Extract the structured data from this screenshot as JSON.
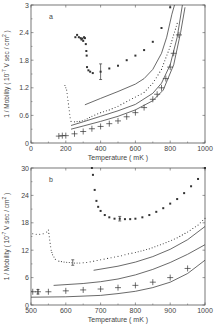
{
  "chart_data": [
    {
      "type": "scatter",
      "panel_label": "a",
      "title": "",
      "xlabel": "Temperature (mK)",
      "ylabel": "1 / Mobility (10^-7 V sec / cm^2)",
      "xlim": [
        0,
        1000
      ],
      "ylim": [
        0,
        3
      ],
      "xticks": [
        "0",
        "200",
        "400",
        "600",
        "800",
        "1000"
      ],
      "yticks": [
        "0",
        "0.6",
        "1.2",
        "1.8",
        "2.4",
        "3"
      ],
      "grid": false,
      "legend": "none",
      "series": [
        {
          "name": "upper dots (filled squares)",
          "style": "square-markers",
          "points": [
            [
              255,
              2.3
            ],
            [
              265,
              2.35
            ],
            [
              275,
              2.3
            ],
            [
              285,
              2.28
            ],
            [
              290,
              2.25
            ],
            [
              295,
              2.27
            ],
            [
              300,
              2.22
            ],
            [
              305,
              2.3
            ],
            [
              310,
              2.28
            ],
            [
              315,
              2.15
            ],
            [
              318,
              2.0
            ],
            [
              320,
              1.9
            ],
            [
              322,
              1.65
            ],
            [
              330,
              1.58
            ],
            [
              340,
              1.55
            ],
            [
              355,
              1.52
            ],
            [
              400,
              1.55
            ],
            [
              450,
              1.62
            ],
            [
              500,
              1.68
            ],
            [
              550,
              1.8
            ],
            [
              600,
              1.9
            ],
            [
              650,
              2.02
            ],
            [
              700,
              2.2
            ],
            [
              750,
              2.5
            ],
            [
              800,
              2.95
            ]
          ],
          "error_bar": {
            "x": 400,
            "y": 1.55,
            "low": 1.38,
            "high": 1.72
          }
        },
        {
          "name": "small dots (steep rise near 200 mK)",
          "style": "dot-markers",
          "points": [
            [
              195,
              1.25
            ],
            [
              205,
              1.15
            ],
            [
              210,
              1.0
            ],
            [
              215,
              0.85
            ],
            [
              220,
              0.7
            ],
            [
              225,
              0.55
            ],
            [
              230,
              0.47
            ],
            [
              250,
              0.46
            ],
            [
              280,
              0.47
            ],
            [
              310,
              0.5
            ],
            [
              350,
              0.58
            ],
            [
              400,
              0.66
            ],
            [
              450,
              0.72
            ],
            [
              500,
              0.8
            ],
            [
              550,
              0.9
            ],
            [
              600,
              1.0
            ],
            [
              650,
              1.1
            ],
            [
              700,
              1.3
            ],
            [
              750,
              1.6
            ],
            [
              800,
              2.1
            ],
            [
              840,
              2.6
            ]
          ]
        },
        {
          "name": "plus markers with bars",
          "style": "plus-markers",
          "points": [
            [
              160,
              0.15
            ],
            [
              180,
              0.16
            ],
            [
              200,
              0.16
            ],
            [
              250,
              0.2
            ],
            [
              300,
              0.25
            ],
            [
              350,
              0.31
            ],
            [
              400,
              0.36
            ],
            [
              450,
              0.42
            ],
            [
              500,
              0.48
            ],
            [
              550,
              0.57
            ],
            [
              600,
              0.66
            ],
            [
              650,
              0.77
            ],
            [
              700,
              0.95
            ],
            [
              725,
              1.06
            ],
            [
              750,
              1.2
            ],
            [
              775,
              1.4
            ],
            [
              800,
              1.65
            ],
            [
              820,
              1.95
            ],
            [
              850,
              2.35
            ]
          ]
        },
        {
          "name": "solid curve 1 (upper)",
          "style": "line",
          "points": [
            [
              310,
              0.83
            ],
            [
              400,
              0.97
            ],
            [
              500,
              1.12
            ],
            [
              600,
              1.28
            ],
            [
              650,
              1.4
            ],
            [
              700,
              1.6
            ],
            [
              750,
              1.95
            ],
            [
              780,
              2.3
            ],
            [
              810,
              2.8
            ],
            [
              825,
              3.0
            ]
          ]
        },
        {
          "name": "solid curve 2 (middle)",
          "style": "line",
          "points": [
            [
              230,
              0.38
            ],
            [
              300,
              0.46
            ],
            [
              400,
              0.58
            ],
            [
              500,
              0.7
            ],
            [
              600,
              0.84
            ],
            [
              700,
              1.08
            ],
            [
              750,
              1.3
            ],
            [
              800,
              1.7
            ],
            [
              840,
              2.3
            ],
            [
              870,
              3.0
            ]
          ]
        },
        {
          "name": "solid curve 3 (lower)",
          "style": "line",
          "points": [
            [
              230,
              0.3
            ],
            [
              300,
              0.37
            ],
            [
              400,
              0.47
            ],
            [
              500,
              0.58
            ],
            [
              600,
              0.72
            ],
            [
              700,
              0.92
            ],
            [
              760,
              1.15
            ],
            [
              820,
              1.7
            ],
            [
              860,
              2.4
            ],
            [
              885,
              2.95
            ]
          ]
        }
      ]
    },
    {
      "type": "scatter",
      "panel_label": "b",
      "title": "",
      "xlabel": "Temperature (mK)",
      "ylabel": "1 / Mobility (10^-7 V sec / cm^2)",
      "xlim": [
        500,
        1000
      ],
      "ylim": [
        0,
        30
      ],
      "xticks": [
        "500",
        "600",
        "700",
        "800",
        "900",
        "1000"
      ],
      "yticks": [
        "0",
        "6",
        "12",
        "18",
        "24",
        "30"
      ],
      "grid": false,
      "legend": "none",
      "series": [
        {
          "name": "upper dots (filled squares)",
          "style": "square-markers",
          "points": [
            [
              675,
              30
            ],
            [
              678,
              28.5
            ],
            [
              683,
              25.2
            ],
            [
              688,
              22.8
            ],
            [
              693,
              21.5
            ],
            [
              700,
              20.6
            ],
            [
              712,
              19.7
            ],
            [
              725,
              19.2
            ],
            [
              740,
              18.9
            ],
            [
              755,
              18.9
            ],
            [
              770,
              18.8
            ],
            [
              785,
              18.8
            ],
            [
              800,
              18.9
            ],
            [
              820,
              19.2
            ],
            [
              840,
              19.7
            ],
            [
              860,
              20.4
            ],
            [
              880,
              21.2
            ],
            [
              900,
              22.2
            ],
            [
              920,
              23.2
            ],
            [
              940,
              24.5
            ],
            [
              960,
              26
            ],
            [
              980,
              27.6
            ],
            [
              1000,
              30
            ]
          ],
          "error_bar": {
            "x": 755,
            "y": 18.9,
            "low": 18.4,
            "high": 19.4
          }
        },
        {
          "name": "small dots (step near 550 mK)",
          "style": "dot-markers",
          "points": [
            [
              505,
              15.6
            ],
            [
              515,
              15.5
            ],
            [
              525,
              15.5
            ],
            [
              535,
              15.6
            ],
            [
              545,
              16.0
            ],
            [
              550,
              16.4
            ],
            [
              555,
              13.5
            ],
            [
              558,
              12.0
            ],
            [
              562,
              11.0
            ],
            [
              570,
              10.0
            ],
            [
              580,
              9.6
            ],
            [
              595,
              9.4
            ],
            [
              610,
              9.3
            ],
            [
              625,
              9.2
            ],
            [
              640,
              9.2
            ],
            [
              660,
              9.3
            ],
            [
              680,
              9.6
            ],
            [
              700,
              9.9
            ],
            [
              720,
              10.2
            ],
            [
              740,
              10.5
            ],
            [
              760,
              10.8
            ],
            [
              780,
              11.2
            ],
            [
              800,
              11.5
            ],
            [
              840,
              12.3
            ],
            [
              880,
              13.4
            ],
            [
              920,
              14.7
            ],
            [
              950,
              16.0
            ],
            [
              980,
              17.5
            ],
            [
              1000,
              19
            ]
          ],
          "error_bar": {
            "x": 620,
            "y": 9.3,
            "low": 8.7,
            "high": 9.9
          }
        },
        {
          "name": "plus markers",
          "style": "plus-markers",
          "points": [
            [
              505,
              2.9
            ],
            [
              520,
              2.9
            ],
            [
              550,
              2.9
            ],
            [
              600,
              3.1
            ],
            [
              650,
              3.3
            ],
            [
              700,
              3.5
            ],
            [
              750,
              3.8
            ],
            [
              800,
              4.3
            ],
            [
              850,
              5.0
            ],
            [
              900,
              6.0
            ],
            [
              950,
              8.0
            ]
          ],
          "error_bar": {
            "x": 520,
            "y": 2.9,
            "low": 2.4,
            "high": 3.4
          }
        },
        {
          "name": "solid curve 1 (upper)",
          "style": "line",
          "points": [
            [
              680,
              7.6
            ],
            [
              750,
              8.5
            ],
            [
              800,
              9.4
            ],
            [
              850,
              10.6
            ],
            [
              900,
              12.2
            ],
            [
              950,
              14.3
            ],
            [
              1000,
              17.2
            ]
          ]
        },
        {
          "name": "solid curve 2 (middle)",
          "style": "line",
          "points": [
            [
              565,
              4.3
            ],
            [
              650,
              4.7
            ],
            [
              700,
              5.1
            ],
            [
              750,
              5.7
            ],
            [
              800,
              6.6
            ],
            [
              850,
              7.8
            ],
            [
              900,
              9.3
            ],
            [
              950,
              11.1
            ],
            [
              1000,
              13.2
            ]
          ]
        },
        {
          "name": "solid curve 3 (lower)",
          "style": "line",
          "points": [
            [
              500,
              1.7
            ],
            [
              600,
              1.8
            ],
            [
              700,
              2.1
            ],
            [
              750,
              2.5
            ],
            [
              800,
              3.0
            ],
            [
              850,
              3.8
            ],
            [
              900,
              5.0
            ],
            [
              950,
              6.9
            ],
            [
              1000,
              9.8
            ]
          ]
        }
      ]
    }
  ],
  "panels": {
    "a": {
      "label": "a"
    },
    "b": {
      "label": "b"
    }
  },
  "layout": {
    "a": {
      "left": 31,
      "right": 205,
      "top": 5,
      "bottom": 143
    },
    "b": {
      "left": 31,
      "right": 205,
      "top": 168,
      "bottom": 305
    }
  },
  "colors": {
    "ink": "#444444",
    "axis": "#555555",
    "marker": "#333333",
    "background": "#ffffff"
  }
}
